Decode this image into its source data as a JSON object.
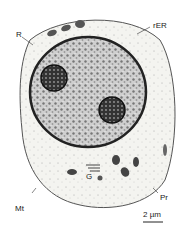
{
  "figure": {
    "labels": {
      "R": "R",
      "rER": "rER",
      "G": "G",
      "Pr": "Pr",
      "Mt": "Mt",
      "scale": "2 µm"
    }
  }
}
